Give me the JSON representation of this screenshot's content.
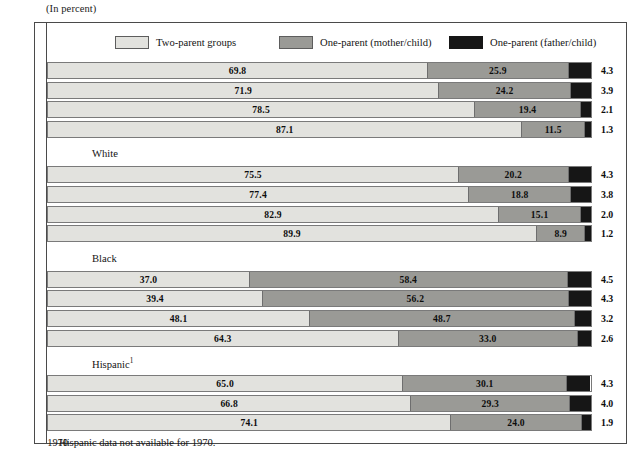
{
  "caption": "(In percent)",
  "legend": {
    "items": [
      {
        "key": "two",
        "label": "Two-parent groups",
        "color": "#e2e2de"
      },
      {
        "key": "mom",
        "label": "One-parent (mother/child)",
        "color": "#9a9a96"
      },
      {
        "key": "dad",
        "label": "One-parent (father/child)",
        "color": "#161616"
      }
    ]
  },
  "no_data_note": "Hispanic data not available for 1970.",
  "chart_data": {
    "type": "bar",
    "orientation": "horizontal",
    "stacked": true,
    "title": "",
    "subtitle": "(In percent)",
    "xlabel": "",
    "ylabel": "",
    "xlim": [
      0,
      100
    ],
    "grid": false,
    "legend_position": "top",
    "series": [
      {
        "name": "Two-parent groups",
        "key": "two"
      },
      {
        "name": "One-parent (mother/child)",
        "key": "mom"
      },
      {
        "name": "One-parent (father/child)",
        "key": "dad"
      }
    ],
    "groups": [
      {
        "name": "",
        "rows": [
          {
            "year": "1993",
            "two": 69.8,
            "mom": 25.9,
            "dad": 4.3
          },
          {
            "year": "1990",
            "two": 71.9,
            "mom": 24.2,
            "dad": 3.9
          },
          {
            "year": "1980",
            "two": 78.5,
            "mom": 19.4,
            "dad": 2.1
          },
          {
            "year": "1970",
            "two": 87.1,
            "mom": 11.5,
            "dad": 1.3
          }
        ]
      },
      {
        "name": "White",
        "rows": [
          {
            "year": "1993",
            "two": 75.5,
            "mom": 20.2,
            "dad": 4.3
          },
          {
            "year": "1990",
            "two": 77.4,
            "mom": 18.8,
            "dad": 3.8
          },
          {
            "year": "1980",
            "two": 82.9,
            "mom": 15.1,
            "dad": 2.0
          },
          {
            "year": "1970",
            "two": 89.9,
            "mom": 8.9,
            "dad": 1.2
          }
        ]
      },
      {
        "name": "Black",
        "rows": [
          {
            "year": "1993",
            "two": 37.0,
            "mom": 58.4,
            "dad": 4.5
          },
          {
            "year": "1990",
            "two": 39.4,
            "mom": 56.2,
            "dad": 4.3
          },
          {
            "year": "1980",
            "two": 48.1,
            "mom": 48.7,
            "dad": 3.2
          },
          {
            "year": "1970",
            "two": 64.3,
            "mom": 33.0,
            "dad": 2.6
          }
        ]
      },
      {
        "name": "Hispanic",
        "name_superscript": "1",
        "rows": [
          {
            "year": "1993",
            "two": 65.0,
            "mom": 30.1,
            "dad": 4.3
          },
          {
            "year": "1990",
            "two": 66.8,
            "mom": 29.3,
            "dad": 4.0
          },
          {
            "year": "1980",
            "two": 74.1,
            "mom": 24.0,
            "dad": 1.9
          },
          {
            "year": "1970",
            "no_data": true,
            "note": "Hispanic data not available for 1970."
          }
        ]
      }
    ]
  }
}
